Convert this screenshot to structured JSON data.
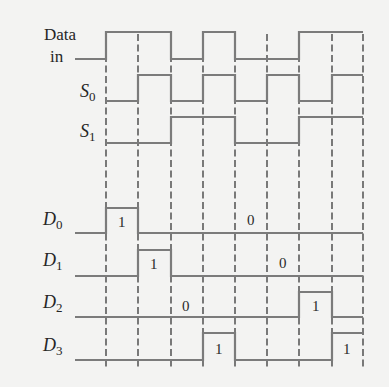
{
  "diagram": {
    "type": "timing-diagram",
    "colors": {
      "background": "#f3f3f2",
      "signal": "#7b7b7b",
      "dash": "#5a5a5a",
      "text": "#262626"
    },
    "time_boundaries_px": [
      106,
      138,
      171,
      203,
      235,
      267,
      299,
      332,
      363
    ],
    "signals": [
      {
        "id": "data_in",
        "label_line1": "Data",
        "label_line2": "in",
        "values": [
          1,
          1,
          0,
          1,
          0,
          0,
          1,
          1
        ]
      },
      {
        "id": "s0",
        "label": "S",
        "subscript": "0",
        "values": [
          0,
          1,
          0,
          1,
          0,
          1,
          0,
          1
        ]
      },
      {
        "id": "s1",
        "label": "S",
        "subscript": "1",
        "values": [
          0,
          0,
          1,
          1,
          0,
          0,
          1,
          1
        ]
      },
      {
        "id": "d0",
        "label": "D",
        "subscript": "0",
        "values": [
          1,
          0,
          0,
          0,
          0,
          0,
          0,
          0
        ],
        "annotations": [
          "1",
          "0"
        ]
      },
      {
        "id": "d1",
        "label": "D",
        "subscript": "1",
        "values": [
          0,
          1,
          0,
          0,
          0,
          0,
          0,
          0
        ],
        "annotations": [
          "1",
          "0"
        ]
      },
      {
        "id": "d2",
        "label": "D",
        "subscript": "2",
        "values": [
          0,
          0,
          0,
          0,
          0,
          0,
          1,
          0
        ],
        "annotations": [
          "0",
          "1"
        ]
      },
      {
        "id": "d3",
        "label": "D",
        "subscript": "3",
        "values": [
          0,
          0,
          0,
          1,
          0,
          0,
          0,
          1
        ],
        "annotations": [
          "1",
          "1"
        ]
      }
    ]
  }
}
